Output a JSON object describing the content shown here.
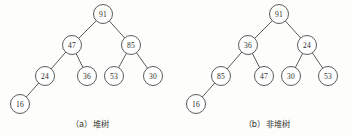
{
  "figure": {
    "background_color": "#fdfdfc",
    "ink_color": "#4a4a48",
    "text_color": "#2d2d2b"
  },
  "chart_data": {
    "type": "diagram",
    "subtype": "binary-tree",
    "title": "",
    "panels": [
      {
        "id": "panel-a",
        "caption": "（a）堆树",
        "caption_label": "(a)",
        "caption_name": "堆树",
        "nodes": [
          {
            "id": "a0",
            "value": "91",
            "x": 103,
            "y": 14,
            "r": 9.5,
            "level": 0
          },
          {
            "id": "a1",
            "value": "47",
            "x": 72,
            "y": 45,
            "r": 9.5,
            "level": 1
          },
          {
            "id": "a2",
            "value": "85",
            "x": 131,
            "y": 45,
            "r": 9.5,
            "level": 1
          },
          {
            "id": "a3",
            "value": "24",
            "x": 45,
            "y": 76,
            "r": 9.5,
            "level": 2
          },
          {
            "id": "a4",
            "value": "36",
            "x": 87,
            "y": 76,
            "r": 9.5,
            "level": 2
          },
          {
            "id": "a5",
            "value": "53",
            "x": 114,
            "y": 76,
            "r": 9.5,
            "level": 2
          },
          {
            "id": "a6",
            "value": "30",
            "x": 153,
            "y": 76,
            "r": 9.5,
            "level": 2
          },
          {
            "id": "a7",
            "value": "16",
            "x": 20,
            "y": 104,
            "r": 9.5,
            "level": 3
          }
        ],
        "edges": [
          {
            "from": "a0",
            "to": "a1"
          },
          {
            "from": "a0",
            "to": "a2"
          },
          {
            "from": "a1",
            "to": "a3"
          },
          {
            "from": "a1",
            "to": "a4"
          },
          {
            "from": "a2",
            "to": "a5"
          },
          {
            "from": "a2",
            "to": "a6"
          },
          {
            "from": "a3",
            "to": "a7"
          }
        ],
        "caption_x": 90,
        "caption_y": 124
      },
      {
        "id": "panel-b",
        "caption": "（b）非堆树",
        "caption_label": "(b)",
        "caption_name": "非堆树",
        "nodes": [
          {
            "id": "b0",
            "value": "91",
            "x": 279,
            "y": 14,
            "r": 9.5,
            "level": 0
          },
          {
            "id": "b1",
            "value": "36",
            "x": 248,
            "y": 45,
            "r": 9.5,
            "level": 1
          },
          {
            "id": "b2",
            "value": "24",
            "x": 307,
            "y": 45,
            "r": 9.5,
            "level": 1
          },
          {
            "id": "b3",
            "value": "85",
            "x": 221,
            "y": 76,
            "r": 9.5,
            "level": 2
          },
          {
            "id": "b4",
            "value": "47",
            "x": 264,
            "y": 76,
            "r": 9.5,
            "level": 2
          },
          {
            "id": "b5",
            "value": "30",
            "x": 291,
            "y": 76,
            "r": 9.5,
            "level": 2
          },
          {
            "id": "b6",
            "value": "53",
            "x": 328,
            "y": 76,
            "r": 9.5,
            "level": 2
          },
          {
            "id": "b7",
            "value": "16",
            "x": 196,
            "y": 104,
            "r": 9.5,
            "level": 3
          }
        ],
        "edges": [
          {
            "from": "b0",
            "to": "b1"
          },
          {
            "from": "b0",
            "to": "b2"
          },
          {
            "from": "b1",
            "to": "b3"
          },
          {
            "from": "b1",
            "to": "b4"
          },
          {
            "from": "b2",
            "to": "b5"
          },
          {
            "from": "b2",
            "to": "b6"
          },
          {
            "from": "b3",
            "to": "b7"
          }
        ],
        "caption_x": 267,
        "caption_y": 124
      }
    ]
  }
}
